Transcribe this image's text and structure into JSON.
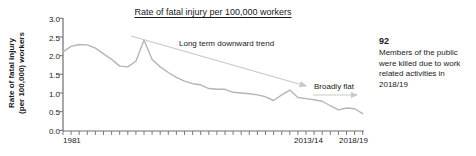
{
  "chart": {
    "title": "Rate of fatal injury per 100,000 workers",
    "y_axis_label_line1": "Rate of fatal injury",
    "y_axis_label_line2": "(per 100,000) workers",
    "y_ticks": [
      "3.0",
      "2.5",
      "2.0",
      "1.5",
      "1.0",
      "0.5",
      "0.0"
    ],
    "x_ticks": [
      "1981",
      "2013/14",
      "2018/19"
    ],
    "annotation_trend": "Long term downward trend",
    "annotation_flat": "Broadly flat",
    "line_color": "#b5b5b5",
    "axis_color": "#6e6e6e",
    "arrow_color": "#c9c9c9",
    "text_color": "#1a1a1a"
  },
  "callout": {
    "number": "92",
    "text": "Members of the public were killed due to work related activities in 2018/19"
  },
  "chart_data": {
    "type": "line",
    "title": "Rate of fatal injury per 100,000 workers",
    "xlabel": "",
    "ylabel": "Rate of fatal injury (per 100,000) workers",
    "ylim": [
      0.0,
      3.0
    ],
    "grid": false,
    "legend": "none",
    "x": [
      "1981",
      "1982",
      "1983",
      "1984",
      "1985",
      "1986",
      "1987",
      "1988",
      "1989",
      "1990",
      "1991",
      "1992",
      "1993",
      "1994",
      "1995/96",
      "1996/97",
      "1997/98",
      "1998/99",
      "1999/00",
      "2000/01",
      "2001/02",
      "2002/03",
      "2003/04",
      "2004/05",
      "2005/06",
      "2006/07",
      "2007/08",
      "2008/09",
      "2009/10",
      "2010/11",
      "2011/12",
      "2012/13",
      "2013/14",
      "2014/15",
      "2015/16",
      "2016/17",
      "2017/18",
      "2018/19"
    ],
    "values": [
      2.1,
      2.25,
      2.3,
      2.29,
      2.2,
      2.05,
      1.9,
      1.72,
      1.7,
      1.85,
      2.42,
      1.9,
      1.7,
      1.55,
      1.42,
      1.32,
      1.25,
      1.22,
      1.12,
      1.1,
      1.1,
      1.02,
      1.0,
      0.98,
      0.95,
      0.9,
      0.8,
      0.95,
      1.08,
      0.88,
      0.85,
      0.82,
      0.78,
      0.66,
      0.55,
      0.6,
      0.58,
      0.45
    ],
    "annotations": [
      {
        "text": "Long term downward trend",
        "type": "arrow",
        "note": "diagonal arrow from upper-left to lower-right across the series"
      },
      {
        "text": "Broadly flat",
        "type": "arrow",
        "note": "short horizontal arrow at the right end of the series"
      }
    ]
  }
}
